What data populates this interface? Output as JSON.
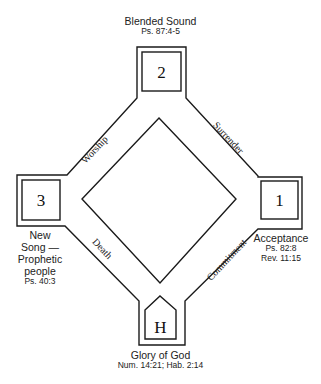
{
  "diagram": {
    "stations": [
      {
        "id": "top",
        "number": "2",
        "title": "Blended Sound",
        "refs": [
          "Ps. 87:4-5"
        ]
      },
      {
        "id": "right",
        "number": "1",
        "title": "Acceptance",
        "refs": [
          "Ps. 82:8",
          "Rev. 11:15"
        ]
      },
      {
        "id": "left",
        "number": "3",
        "title_lines": [
          "New",
          "Song —",
          "Prophetic",
          "people"
        ],
        "refs": [
          "Ps. 40:3"
        ]
      },
      {
        "id": "bottom",
        "number": "H",
        "title": "Glory of God",
        "refs": [
          "Num. 14:21; Hab. 2:14"
        ]
      }
    ],
    "paths": {
      "top_left": "Worship",
      "top_right": "Surrender",
      "bottom_left": "Death",
      "bottom_right": "Commitment"
    },
    "colors": {
      "line": "#1a1a1a",
      "text": "#222222",
      "background": "#ffffff"
    }
  }
}
